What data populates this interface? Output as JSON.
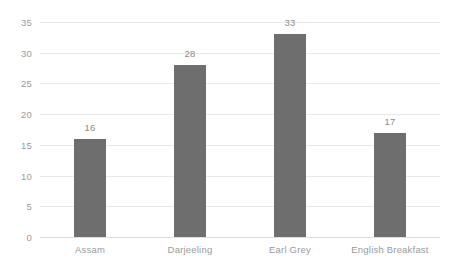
{
  "chart_data": {
    "type": "bar",
    "title": "",
    "subtitle": "",
    "xlabel": "",
    "ylabel": "",
    "categories": [
      "Assam",
      "Darjeeling",
      "Earl Grey",
      "English Breakfast"
    ],
    "values": [
      16,
      28,
      33,
      17
    ],
    "value_labels": [
      "16",
      "28",
      "33",
      "17"
    ],
    "ylim": [
      0,
      35
    ],
    "y_ticks": [
      0,
      5,
      10,
      15,
      20,
      25,
      30,
      35
    ],
    "y_tick_labels": [
      "0",
      "5",
      "10",
      "15",
      "20",
      "25",
      "30",
      "35"
    ],
    "grid": "horizontal",
    "legend": "none",
    "orientation": "vertical",
    "colors": {
      "bar": "#6e6e6e",
      "gridline": "#e8e8e8",
      "baseline": "#dedede",
      "tick_text": "#9a9a9a",
      "value_text": "#8a8a8a",
      "background": "#ffffff"
    }
  }
}
